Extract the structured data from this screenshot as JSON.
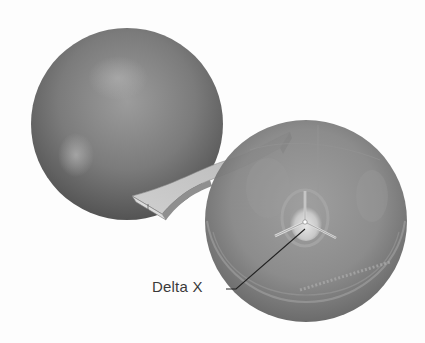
{
  "figure": {
    "background": "#fdfdfd"
  },
  "objects": {
    "left_sphere": {
      "cx": 127,
      "cy": 124,
      "r": 96,
      "color": "#7a7a7a"
    },
    "right_sphere": {
      "cx": 306,
      "cy": 221,
      "r": 101,
      "color": "#858585"
    },
    "ribbon": {
      "color": "#c2c2c2",
      "edge_color": "#6f6f6f"
    },
    "triad": {
      "cx": 305,
      "cy": 222,
      "color": "#d8d8d8"
    }
  },
  "callouts": [
    {
      "id": "delta-x",
      "label": "Delta X",
      "label_x": 152,
      "label_y": 282,
      "leader": [
        [
          226,
          289
        ],
        [
          236,
          289
        ],
        [
          305,
          229
        ]
      ]
    }
  ]
}
